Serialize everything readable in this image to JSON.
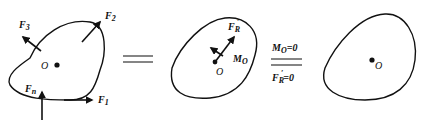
{
  "diagram": {
    "type": "force-system-equilibrium",
    "panels": [
      {
        "id": "original-force-system",
        "point_label": "O",
        "forces": [
          {
            "symbol": "F",
            "subscript": "1",
            "direction": "right"
          },
          {
            "symbol": "F",
            "subscript": "2",
            "direction": "up-right"
          },
          {
            "symbol": "F",
            "subscript": "3",
            "direction": "up-left"
          },
          {
            "symbol": "F",
            "subscript": "n",
            "direction": "up"
          }
        ]
      },
      {
        "id": "reduced-system",
        "point_label": "O",
        "resultant": {
          "symbol": "F",
          "subscript": "R",
          "prime": "′"
        },
        "moment": {
          "symbol": "M",
          "subscript": "O"
        }
      },
      {
        "id": "equilibrium-body",
        "point_label": "O"
      }
    ],
    "equivalence_sign_1": "equals",
    "conditions": {
      "top": {
        "symbol": "M",
        "subscript": "O",
        "rhs": "=0"
      },
      "bottom": {
        "symbol": "F",
        "subscript": "R",
        "prime": "′",
        "rhs": "=0"
      }
    }
  }
}
